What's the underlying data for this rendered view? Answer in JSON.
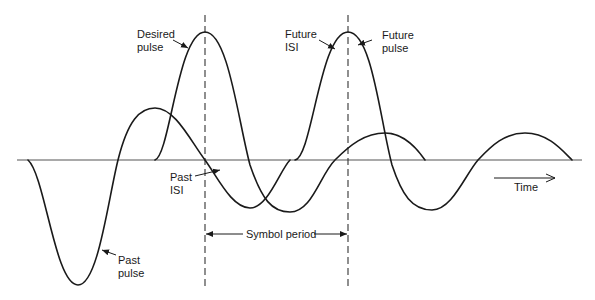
{
  "labels": {
    "desired_pulse": "Desired\npulse",
    "future_isi": "Future\nISI",
    "future_pulse": "Future\npulse",
    "past_isi": "Past\nISI",
    "past_pulse": "Past\npulse",
    "symbol_period": "Symbol period",
    "time": "Time"
  },
  "icons": {
    "time_arrow": "right-arrow",
    "symbol_period_arrows": "double-headed-arrow"
  },
  "colors": {
    "stroke": "#1a1a1a",
    "axis": "#555555",
    "background": "#ffffff"
  }
}
